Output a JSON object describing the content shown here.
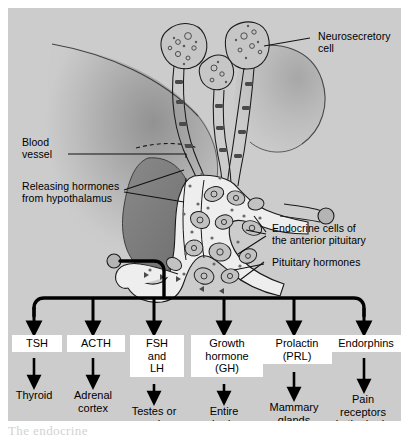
{
  "figure": {
    "background_color": "#cccccc",
    "page_color": "#ffffff",
    "caption_fragment": "The  endocrine"
  },
  "anatomy_labels": [
    {
      "id": "neurosecretory-cell",
      "text": "Neurosecretory\ncell"
    },
    {
      "id": "blood-vessel",
      "text": "Blood\nvessel"
    },
    {
      "id": "releasing-hormones",
      "text": "Releasing hormones\nfrom hypothalamus"
    },
    {
      "id": "endocrine-cells",
      "text": "Endocrine cells of\nthe anterior pituitary"
    },
    {
      "id": "pituitary-hormones",
      "text": "Pituitary hormones"
    }
  ],
  "anatomy_parts": {
    "brain": "brain-outline",
    "posterior_lobe": "posterior-pituitary-lobe",
    "anterior_lobe": "anterior-pituitary-lobe",
    "neurosecretory_cells": "neurosecretory-cell-bodies",
    "capillary_network": "capillary-network",
    "vessel_inlet": "blood-vessel-inlet",
    "vessel_outlet": "blood-vessel-outlet"
  },
  "flowchart": {
    "type": "branching-arrow-diagram",
    "source": "anterior pituitary blood vessel",
    "columns": [
      {
        "hormone": "TSH",
        "target": "Thyroid"
      },
      {
        "hormone": "ACTH",
        "target": "Adrenal\ncortex"
      },
      {
        "hormone": "FSH\nand\nLH",
        "target": "Testes or\novaries"
      },
      {
        "hormone": "Growth\nhormone\n(GH)",
        "target": "Entire\nbody"
      },
      {
        "hormone": "Prolactin\n(PRL)",
        "target": "Mammary\nglands\n(in mammals)"
      },
      {
        "hormone": "Endorphins",
        "target": "Pain\nreceptors\nin the brain"
      }
    ]
  },
  "colors": {
    "panel": "#cccccc",
    "brain_light": "#c4c4c4",
    "brain_shade": "#9a9a9a",
    "posterior_lobe": "#7f7f7f",
    "capillary_fill": "#f0f0f0",
    "cell_fill": "#c9c9c9",
    "stroke": "#1a1a1a",
    "box_fill": "#ffffff"
  }
}
